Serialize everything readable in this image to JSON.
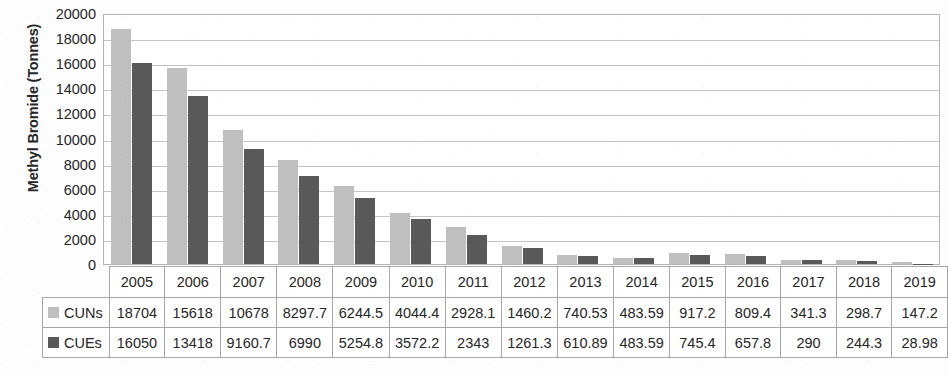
{
  "chart_data": {
    "type": "bar",
    "title": "",
    "xlabel": "",
    "ylabel": "Methyl Bromide (Tonnes)",
    "ylim": [
      0,
      20000
    ],
    "ytick_step": 2000,
    "yticks": [
      20000,
      18000,
      16000,
      14000,
      12000,
      10000,
      8000,
      6000,
      4000,
      2000,
      0
    ],
    "ytick_labels": [
      "20000",
      "18000",
      "16000",
      "14000",
      "12000",
      "10000",
      "8000",
      "6000",
      "4000",
      "2000",
      "0"
    ],
    "grid": true,
    "legend_position": "data-table-row-headers",
    "categories": [
      "2005",
      "2006",
      "2007",
      "2008",
      "2009",
      "2010",
      "2011",
      "2012",
      "2013",
      "2014",
      "2015",
      "2016",
      "2017",
      "2018",
      "2019"
    ],
    "series": [
      {
        "name": "CUNs",
        "color": "#bfbfbf",
        "values": [
          18704,
          15618,
          10678,
          8297.7,
          6244.5,
          4044.4,
          2928.1,
          1460.2,
          740.53,
          483.59,
          917.2,
          809.4,
          341.3,
          298.7,
          147.2
        ],
        "labels": [
          "18704",
          "15618",
          "10678",
          "8297.7",
          "6244.5",
          "4044.4",
          "2928.1",
          "1460.2",
          "740.53",
          "483.59",
          "917.2",
          "809.4",
          "341.3",
          "298.7",
          "147.2"
        ]
      },
      {
        "name": "CUEs",
        "color": "#595959",
        "values": [
          16050,
          13418,
          9160.7,
          6990,
          5254.8,
          3572.2,
          2343,
          1261.3,
          610.89,
          483.59,
          745.4,
          657.8,
          290,
          244.3,
          28.98
        ],
        "labels": [
          "16050",
          "13418",
          "9160.7",
          "6990",
          "5254.8",
          "3572.2",
          "2343",
          "1261.3",
          "610.89",
          "483.59",
          "745.4",
          "657.8",
          "290",
          "244.3",
          "28.98"
        ]
      }
    ]
  },
  "colors": {
    "series_cuns": "#bfbfbf",
    "series_cues": "#595959",
    "gridline": "#c4c4c4",
    "plot_border": "#b4b4b4",
    "table_border": "#a6a6a6",
    "text": "#262626",
    "background": "#fdfdfd"
  }
}
